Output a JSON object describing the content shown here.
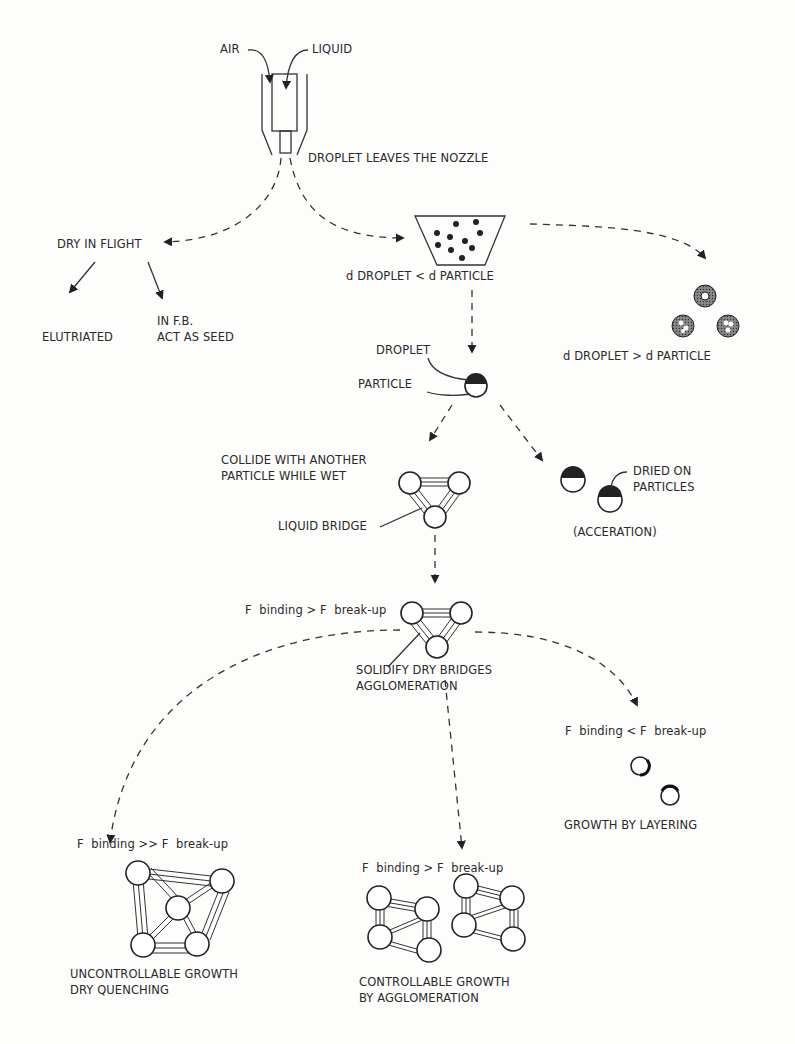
{
  "diagram": {
    "nozzle": {
      "air_label": "AIR",
      "liquid_label": "LIQUID",
      "exit_label": "DROPLET LEAVES THE NOZZLE"
    },
    "branches": {
      "dry_in_flight": {
        "label": "DRY IN FLIGHT",
        "outcomes": [
          "ELUTRIATED",
          "IN F.B.\nACT AS SEED"
        ]
      },
      "small_droplet": {
        "label": "d DROPLET < d PARTICLE"
      },
      "large_droplet": {
        "label": "d DROPLET > d PARTICLE"
      }
    },
    "wetting": {
      "droplet_label": "DROPLET",
      "particle_label": "PARTICLE"
    },
    "collision": {
      "label": "COLLIDE WITH ANOTHER\nPARTICLE WHILE WET",
      "bridge_label": "LIQUID BRIDGE"
    },
    "accretion": {
      "dried_label": "DRIED ON\nPARTICLES",
      "caption": "(ACCERATION)"
    },
    "binding": {
      "condition": "F  binding > F  break-up",
      "caption": "SOLIDIFY DRY BRIDGES\nAGGLOMERATION"
    },
    "outcomes": [
      {
        "condition": "F  binding >> F  break-up",
        "caption": "UNCONTROLLABLE GROWTH\nDRY QUENCHING"
      },
      {
        "condition": "F  binding > F  break-up",
        "caption": "CONTROLLABLE GROWTH\nBY AGGLOMERATION"
      },
      {
        "condition": "F  binding < F  break-up",
        "caption": "GROWTH BY LAYERING"
      }
    ]
  }
}
